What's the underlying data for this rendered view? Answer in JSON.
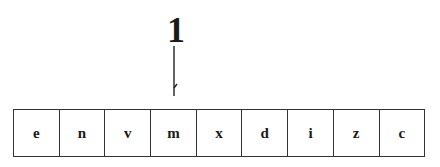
{
  "pointer": {
    "label": "1",
    "target_index": 3
  },
  "tape": {
    "cells": [
      "e",
      "n",
      "v",
      "m",
      "x",
      "d",
      "i",
      "z",
      "c"
    ]
  }
}
